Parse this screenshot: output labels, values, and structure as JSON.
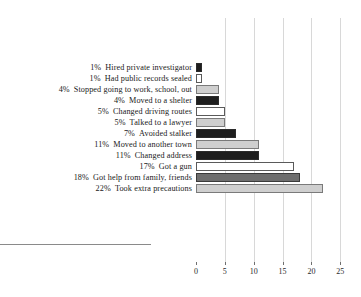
{
  "chart_data": {
    "type": "bar",
    "orientation": "horizontal",
    "title": "",
    "xlabel": "",
    "ylabel": "",
    "xlim": [
      0,
      26
    ],
    "grid": true,
    "legend": "none",
    "categories": [
      "Hired private investigator",
      "Had public records sealed",
      "Stopped going to work, school, out",
      "Moved to a shelter",
      "Changed driving routes",
      "Talked to a lawyer",
      "Avoided stalker",
      "Moved to another town",
      "Changed address",
      "Got a gun",
      "Got help from family, friends",
      "Took extra precautions"
    ],
    "values": [
      1,
      1,
      4,
      4,
      5,
      5,
      7,
      11,
      11,
      17,
      18,
      22
    ],
    "value_labels": [
      "1%",
      "1%",
      "4%",
      "4%",
      "5%",
      "5%",
      "7%",
      "11%",
      "11%",
      "17%",
      "18%",
      "22%"
    ],
    "bar_styles": [
      "dark",
      "white",
      "light",
      "dark",
      "white",
      "light",
      "dark",
      "light",
      "dark",
      "white",
      "mid",
      "light"
    ],
    "xticks": [
      0,
      5,
      10,
      15,
      20,
      25
    ],
    "xtick_labels": [
      "0",
      "5",
      "10",
      "15",
      "20",
      "25"
    ]
  },
  "rows": [
    {
      "pct": "1%",
      "text": "Hired private investigator"
    },
    {
      "pct": "1%",
      "text": "Had public records sealed"
    },
    {
      "pct": "4%",
      "text": "Stopped going to work, school, out"
    },
    {
      "pct": "4%",
      "text": "Moved to a shelter"
    },
    {
      "pct": "5%",
      "text": "Changed driving routes"
    },
    {
      "pct": "5%",
      "text": "Talked to a lawyer"
    },
    {
      "pct": "7%",
      "text": "Avoided stalker"
    },
    {
      "pct": "11%",
      "text": "Moved to another town"
    },
    {
      "pct": "11%",
      "text": "Changed address"
    },
    {
      "pct": "17%",
      "text": "Got a gun"
    },
    {
      "pct": "18%",
      "text": "Got help from family, friends"
    },
    {
      "pct": "22%",
      "text": "Took extra precautions"
    }
  ],
  "colors": {
    "bar_dark": "#1e1e1e",
    "bar_light": "#cfcfcf",
    "bar_mid": "#6e6e6e",
    "bar_white": "#ffffff",
    "gridline": "#d8d8d8",
    "axis": "#8a8a8a",
    "text": "#1a1a1a",
    "background": "#ffffff"
  }
}
